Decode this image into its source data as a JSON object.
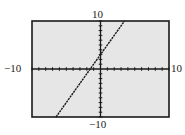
{
  "chart_data": {
    "type": "line",
    "title": "",
    "xlabel": "",
    "ylabel": "",
    "xlim": [
      -10,
      10
    ],
    "ylim": [
      -10,
      10
    ],
    "xscale": 1,
    "yscale": 1,
    "grid": false,
    "tick_labels": {
      "x_min": "−10",
      "x_max": "10",
      "y_min": "−10",
      "y_max": "10"
    },
    "series": [
      {
        "name": "y = 2x + 3",
        "equation": "y = 2x + 3",
        "x": [
          -6.5,
          -1.5,
          0,
          3.5
        ],
        "y": [
          -10,
          0,
          3,
          10
        ],
        "style": "dotted-line"
      }
    ]
  },
  "colors": {
    "screen_background": "#e6e6e6",
    "frame": "#1a1a1a",
    "axis": "#1a1a1a",
    "plot_line": "#1a1a1a"
  }
}
